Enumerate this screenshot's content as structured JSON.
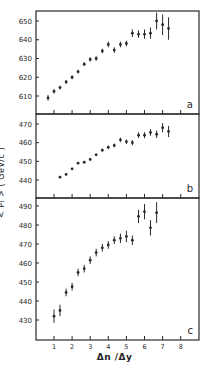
{
  "chart_data": [
    {
      "type": "scatter",
      "panel_label": "a",
      "xlabel": "Δn /Δy",
      "ylabel": "< P_T > ( GeV/c )",
      "ylim": [
        600,
        655
      ],
      "xlim": [
        0,
        9
      ],
      "yticks": [
        610,
        620,
        630,
        640,
        650
      ],
      "xticks": [
        1,
        2,
        3,
        4,
        5,
        6,
        7,
        8
      ],
      "grid": false,
      "error_bars": true,
      "x": [
        0.67,
        1.0,
        1.33,
        1.67,
        2.0,
        2.33,
        2.67,
        3.0,
        3.33,
        3.67,
        4.0,
        4.33,
        4.67,
        5.0,
        5.33,
        5.67,
        6.0,
        6.33,
        6.67,
        7.0,
        7.33
      ],
      "y": [
        609,
        612.5,
        614.5,
        617.5,
        620,
        623,
        627,
        629.5,
        630,
        634,
        637.5,
        634.5,
        637.5,
        638,
        643.5,
        643,
        643,
        643.5,
        650,
        648,
        646
      ],
      "err": [
        1.5,
        1.2,
        1.0,
        1.0,
        1.0,
        1.0,
        1.0,
        1.2,
        1.2,
        1.2,
        1.5,
        1.5,
        1.5,
        1.5,
        2.0,
        2.0,
        2.5,
        3.0,
        4.5,
        5.5,
        6.0
      ]
    },
    {
      "type": "scatter",
      "panel_label": "b",
      "ylim": [
        432,
        473
      ],
      "xlim": [
        0,
        9
      ],
      "yticks": [
        440,
        450,
        460,
        470
      ],
      "xticks": [
        1,
        2,
        3,
        4,
        5,
        6,
        7,
        8
      ],
      "grid": false,
      "error_bars": true,
      "x": [
        1.33,
        1.67,
        2.0,
        2.33,
        2.67,
        3.0,
        3.33,
        3.67,
        4.0,
        4.33,
        4.67,
        5.0,
        5.33,
        5.67,
        6.0,
        6.33,
        6.67,
        7.0,
        7.33
      ],
      "y": [
        441.5,
        443,
        446,
        449,
        449.5,
        451,
        453.5,
        456,
        457.5,
        458.5,
        461.5,
        460.5,
        460,
        464,
        464,
        465.5,
        464.5,
        468,
        466
      ],
      "err": [
        0.4,
        0.4,
        0.5,
        0.5,
        0.5,
        0.6,
        0.6,
        0.8,
        1.0,
        1.0,
        1.2,
        1.2,
        1.4,
        1.5,
        1.6,
        1.8,
        2.0,
        2.5,
        3.0
      ]
    },
    {
      "type": "scatter",
      "panel_label": "c",
      "ylim": [
        420,
        492
      ],
      "xlim": [
        0,
        9
      ],
      "yticks": [
        430,
        440,
        450,
        460,
        470,
        480,
        490
      ],
      "xticks": [
        1,
        2,
        3,
        4,
        5,
        6,
        7,
        8
      ],
      "grid": false,
      "error_bars": true,
      "x": [
        1.0,
        1.33,
        1.67,
        2.0,
        2.33,
        2.67,
        3.0,
        3.33,
        3.67,
        4.0,
        4.33,
        4.67,
        5.0,
        5.33,
        5.67,
        6.0,
        6.33,
        6.67
      ],
      "y": [
        432,
        435,
        444.5,
        447.5,
        455,
        457,
        461.5,
        465.5,
        468,
        469.5,
        472,
        473,
        474,
        472,
        484.5,
        487,
        478.5,
        486.5
      ],
      "err": [
        3.5,
        3.0,
        2.0,
        2.0,
        2.0,
        2.0,
        2.0,
        2.0,
        2.0,
        2.0,
        2.0,
        2.5,
        3.0,
        2.5,
        3.5,
        4.0,
        4.0,
        5.5
      ]
    }
  ],
  "labels": {
    "ylabel": "< Pₜ > ( GeV/c )",
    "xlabel": "Δn /Δy",
    "panel_a": "a",
    "panel_b": "b",
    "panel_c": "c"
  }
}
